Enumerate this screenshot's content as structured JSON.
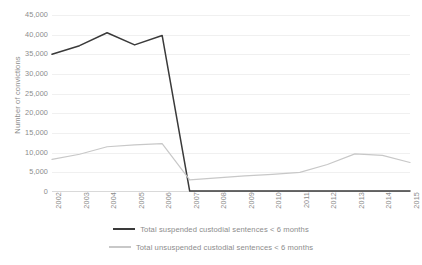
{
  "chart_data": {
    "type": "line",
    "title": "",
    "xlabel": "",
    "ylabel": "Number of convictions",
    "categories": [
      "2002",
      "2003",
      "2004",
      "2005",
      "2006",
      "2007",
      "2008",
      "2009",
      "2010",
      "2011",
      "2012",
      "2013",
      "2014",
      "2015"
    ],
    "ylim": [
      0,
      45000
    ],
    "ytick_labels": [
      "45,000",
      "40,000",
      "35,000",
      "30,000",
      "25,000",
      "20,000",
      "15,000",
      "10,000",
      "5,000",
      "0"
    ],
    "ytick_values": [
      45000,
      40000,
      35000,
      30000,
      25000,
      20000,
      15000,
      10000,
      5000,
      0
    ],
    "grid": true,
    "legend_position": "bottom",
    "series": [
      {
        "name": "Total suspended custodial sentences < 6 months",
        "color": "#3a3a3a",
        "values": [
          35000,
          37200,
          40500,
          37400,
          39800,
          250,
          250,
          250,
          250,
          250,
          250,
          250,
          250,
          250
        ]
      },
      {
        "name": "Total unsuspended custodial sentences < 6 months",
        "color": "#c8c8c8",
        "values": [
          8300,
          9600,
          11500,
          12000,
          12300,
          3100,
          3600,
          4100,
          4500,
          5000,
          7000,
          9700,
          9300,
          7500
        ]
      }
    ]
  },
  "colors": {
    "gridline": "#f0f0f0",
    "axis": "#d9d9d9",
    "tick_text": "#8c8c8c",
    "background": "#ffffff"
  }
}
